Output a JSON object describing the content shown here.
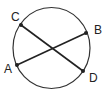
{
  "diagram": {
    "type": "circle-with-intersecting-chords",
    "circle": {
      "cx": 51.5,
      "cy": 48,
      "rx": 38.5,
      "ry": 40.5,
      "stroke": "#333333"
    },
    "points": [
      {
        "id": "A",
        "label": "A",
        "x": 17,
        "y": 65,
        "label_x": 4,
        "label_y": 73
      },
      {
        "id": "B",
        "label": "B",
        "x": 86,
        "y": 33,
        "label_x": 94,
        "label_y": 34
      },
      {
        "id": "C",
        "label": "C",
        "x": 21,
        "y": 25,
        "label_x": 11,
        "label_y": 21
      },
      {
        "id": "D",
        "label": "D",
        "x": 83,
        "y": 71,
        "label_x": 89,
        "label_y": 82
      }
    ],
    "chords": [
      {
        "from": "A",
        "to": "B"
      },
      {
        "from": "C",
        "to": "D"
      }
    ],
    "line_color": "#222222"
  }
}
